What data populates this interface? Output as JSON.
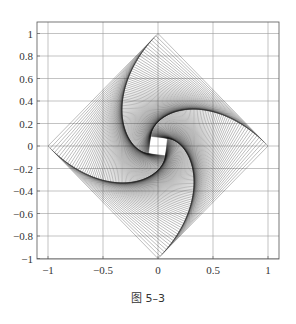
{
  "chart_data": {
    "type": "line",
    "title": "",
    "xlabel": "",
    "ylabel": "",
    "xlim": [
      -1.1,
      1.1
    ],
    "ylim": [
      -1.1,
      1.1
    ],
    "grid": true,
    "legend": null,
    "xticks": [
      -1,
      -0.5,
      0,
      0.5,
      1
    ],
    "xtick_labels": [
      "−1",
      "−0.5",
      "0",
      "0.5",
      "1"
    ],
    "yticks": [
      1,
      0.8,
      0.6,
      0.4,
      0.2,
      0,
      -0.2,
      -0.4,
      -0.6,
      -0.8,
      -1
    ],
    "ytick_labels": [
      "1",
      "0.8",
      "0.6",
      "0.4",
      "0.2",
      "0",
      "−0.2",
      "−0.4",
      "−0.6",
      "−0.8",
      "−1"
    ],
    "outer_square": [
      [
        1,
        0
      ],
      [
        0,
        1
      ],
      [
        -1,
        0
      ],
      [
        0,
        -1
      ]
    ],
    "step_fraction": 0.02,
    "num_squares": 110,
    "line_color": "#1a1a1a"
  },
  "caption": "图 5–3"
}
